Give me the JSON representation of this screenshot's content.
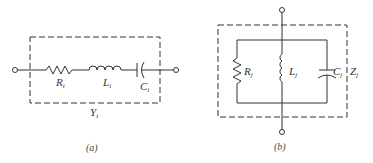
{
  "figure_a": {
    "caption": "(a)",
    "box_label": {
      "main": "Y",
      "sub": "i"
    },
    "components": [
      {
        "type": "resistor",
        "label": {
          "main": "R",
          "sub": "i"
        }
      },
      {
        "type": "inductor",
        "label": {
          "main": "L",
          "sub": "i"
        }
      },
      {
        "type": "capacitor",
        "label": {
          "main": "C",
          "sub": "i"
        }
      }
    ],
    "connection": "series"
  },
  "figure_b": {
    "caption": "(b)",
    "box_label": {
      "main": "Z",
      "sub": "j"
    },
    "components": [
      {
        "type": "resistor",
        "label": {
          "main": "R",
          "sub": "j"
        }
      },
      {
        "type": "inductor",
        "label": {
          "main": "L",
          "sub": "j"
        }
      },
      {
        "type": "capacitor",
        "label": {
          "main": "C",
          "sub": "j"
        }
      }
    ],
    "connection": "parallel"
  },
  "colors": {
    "stroke": "#333333",
    "background": "#ffffff"
  }
}
